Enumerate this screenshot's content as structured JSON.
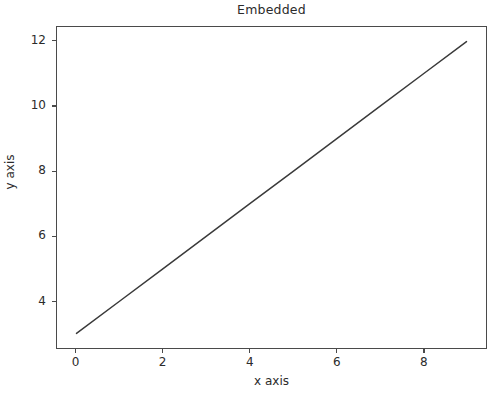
{
  "figure": {
    "background_color": "#ffffff",
    "axes_background_color": "#ffffff",
    "spine_color": "#4a4a4a",
    "text_color": "#2b2b2b"
  },
  "chart_data": {
    "type": "line",
    "title": "Embedded",
    "xlabel": "x axis",
    "ylabel": "y axis",
    "grid": false,
    "legend": null,
    "xlim": [
      -0.45,
      9.45
    ],
    "ylim": [
      2.55,
      12.45
    ],
    "xticks": [
      0,
      2,
      4,
      6,
      8
    ],
    "xticklabels": [
      "0",
      "2",
      "4",
      "6",
      "8"
    ],
    "yticks": [
      4,
      6,
      8,
      10,
      12
    ],
    "yticklabels": [
      "4",
      "6",
      "8",
      "10",
      "12"
    ],
    "series": [
      {
        "name": "line",
        "color": "#3a3a3a",
        "linewidth": 1.5,
        "marker": "none",
        "x": [
          0,
          1,
          2,
          3,
          4,
          5,
          6,
          7,
          8,
          9
        ],
        "y": [
          3,
          4,
          5,
          6,
          7,
          8,
          9,
          10,
          11,
          12
        ]
      }
    ]
  }
}
